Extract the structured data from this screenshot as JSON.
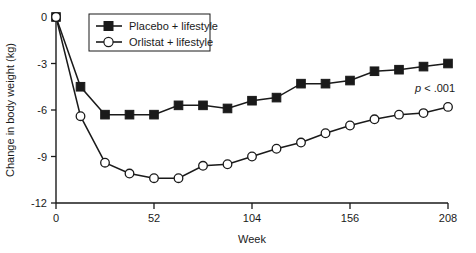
{
  "chart_data": {
    "type": "line",
    "title": "",
    "xlabel": "Week",
    "ylabel": "Change in body weight (kg)",
    "xlim": [
      0,
      208
    ],
    "ylim": [
      -12,
      0
    ],
    "xticks": [
      0,
      52,
      104,
      156,
      208
    ],
    "xtick_labels": [
      "0",
      "52",
      "104",
      "156",
      "208"
    ],
    "yticks": [
      0,
      -3,
      -6,
      -9,
      -12
    ],
    "ytick_labels": [
      "0",
      "-3",
      "-6",
      "-9",
      "-12"
    ],
    "grid": false,
    "legend_position": "top-left-inside",
    "x": [
      0,
      13,
      26,
      39,
      52,
      65,
      78,
      91,
      104,
      117,
      130,
      143,
      156,
      169,
      182,
      195,
      208
    ],
    "series": [
      {
        "name": "Placebo + lifestyle",
        "marker": "filled-square",
        "values": [
          0,
          -4.5,
          -6.3,
          -6.3,
          -6.3,
          -5.7,
          -5.7,
          -5.9,
          -5.4,
          -5.2,
          -4.3,
          -4.3,
          -4.1,
          -3.5,
          -3.4,
          -3.2,
          -3.0
        ]
      },
      {
        "name": "Orlistat + lifestyle",
        "marker": "open-circle",
        "values": [
          0,
          -6.4,
          -9.4,
          -10.1,
          -10.4,
          -10.4,
          -9.6,
          -9.5,
          -9.0,
          -8.5,
          -8.1,
          -7.5,
          -7.0,
          -6.6,
          -6.3,
          -6.2,
          -5.8
        ]
      }
    ],
    "annotations": [
      {
        "name": "p-value",
        "italic_part": "p",
        "rest": " < .001",
        "x": 196,
        "y": -5.0
      }
    ],
    "legend_entries": [
      {
        "label": "Placebo + lifestyle",
        "marker": "filled-square"
      },
      {
        "label": "Orlistat + lifestyle",
        "marker": "open-circle"
      }
    ],
    "colors": {
      "line": "#1a1a1a",
      "marker_fill_placebo": "#1a1a1a",
      "marker_fill_orlistat": "#ffffff",
      "axis": "#1a1a1a",
      "background": "#ffffff"
    }
  }
}
